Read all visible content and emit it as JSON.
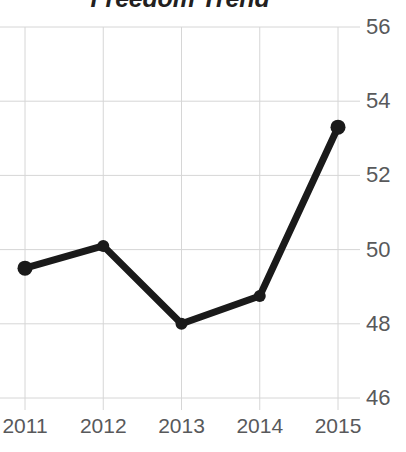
{
  "chart_data": {
    "type": "line",
    "title": "Freedom Trend",
    "xlabel": "",
    "ylabel": "",
    "categories": [
      "2011",
      "2012",
      "2013",
      "2014",
      "2015"
    ],
    "values": [
      49.5,
      50.1,
      48.0,
      48.75,
      53.3
    ],
    "series": [
      {
        "name": "Freedom Trend",
        "values": [
          49.5,
          50.1,
          48.0,
          48.75,
          53.3
        ]
      }
    ],
    "x_tick_labels": [
      "2011",
      "2012",
      "2013",
      "2014",
      "2015"
    ],
    "y_tick_labels": [
      "56",
      "54",
      "52",
      "50",
      "48",
      "46"
    ],
    "y_tick_values": [
      56,
      54,
      52,
      50,
      48,
      46
    ],
    "ylim": [
      45.5,
      56.3
    ],
    "grid": true,
    "grid_horizontal": true,
    "grid_vertical": true,
    "legend": false,
    "legend_position": "none",
    "y_axis_position": "right",
    "marker": "circle",
    "colors": {
      "line": "#1a1a1a",
      "marker": "#1a1a1a",
      "grid": "#d6d6d6",
      "title_text": "#231f20",
      "tick_text": "#58595b",
      "background": "#ffffff"
    }
  }
}
